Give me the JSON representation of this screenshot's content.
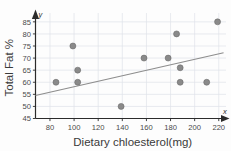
{
  "chart_data": {
    "type": "scatter",
    "title": "",
    "xlabel": "Dietary chloesterol(mg)",
    "ylabel": "Total Fat %",
    "xlim": [
      68,
      226
    ],
    "ylim": [
      45,
      87
    ],
    "xticks": [
      80,
      100,
      120,
      140,
      160,
      180,
      200,
      220
    ],
    "yticks": [
      45,
      50,
      55,
      60,
      65,
      70,
      75,
      80,
      85
    ],
    "xtick_labels": [
      "80",
      "100",
      "120",
      "140",
      "160",
      "180",
      "200",
      "220"
    ],
    "ytick_labels": [
      "45",
      "50",
      "55",
      "60",
      "65",
      "70",
      "75",
      "80",
      "85"
    ],
    "grid": true,
    "legend": null,
    "x_axis_letter": "x",
    "y_axis_letter": "y",
    "points": [
      {
        "x": 85,
        "y": 60
      },
      {
        "x": 99,
        "y": 75
      },
      {
        "x": 103,
        "y": 65
      },
      {
        "x": 103,
        "y": 60
      },
      {
        "x": 139,
        "y": 50
      },
      {
        "x": 158,
        "y": 70
      },
      {
        "x": 178,
        "y": 70
      },
      {
        "x": 185,
        "y": 80
      },
      {
        "x": 188,
        "y": 66
      },
      {
        "x": 188,
        "y": 60
      },
      {
        "x": 210,
        "y": 60
      },
      {
        "x": 219,
        "y": 85
      }
    ],
    "trend_line": {
      "name": "line of best fit",
      "x0": 68,
      "y0": 54.5,
      "x1": 224,
      "y1": 72.2
    },
    "colors": {
      "point_fill": "#8a8a8a",
      "point_stroke": "#646464",
      "trend": "#8d8d8d",
      "axis": "#2b2b2b",
      "grid": "#dfe3ea",
      "text": "#3a3a3a",
      "background": "#fdfdfd"
    }
  }
}
